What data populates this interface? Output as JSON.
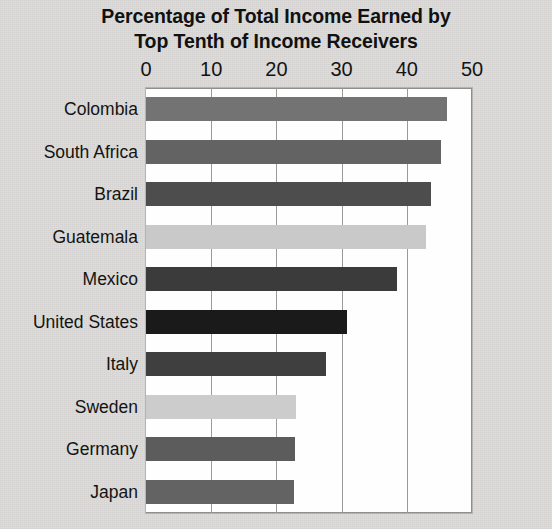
{
  "chart_data": {
    "type": "bar",
    "orientation": "horizontal",
    "title": "Percentage of Total Income Earned by Top Tenth of Income Receivers",
    "title_line1": "Percentage of Total Income Earned by",
    "title_line2": "Top Tenth of Income Receivers",
    "xlabel": "",
    "ylabel": "",
    "xlim": [
      0,
      50
    ],
    "xticks": [
      0,
      10,
      20,
      30,
      40,
      50
    ],
    "xtick_labels": [
      "0",
      "10",
      "20",
      "30",
      "40",
      "50"
    ],
    "grid": "vertical",
    "legend": "none",
    "categories": [
      "Colombia",
      "South Africa",
      "Brazil",
      "Guatemala",
      "Mexico",
      "United States",
      "Italy",
      "Sweden",
      "Germany",
      "Japan"
    ],
    "values": [
      46.1,
      45.3,
      43.7,
      43.0,
      38.5,
      30.8,
      27.6,
      23.0,
      22.9,
      22.7
    ],
    "bar_colors": [
      "#737373",
      "#636363",
      "#4d4d4d",
      "#c9c9c9",
      "#3b3b3b",
      "#1a1a1a",
      "#3f3f3f",
      "#cccccc",
      "#5c5c5c",
      "#636363"
    ],
    "bars": [
      {
        "label": "Colombia",
        "value": 46.1,
        "color": "#737373"
      },
      {
        "label": "South Africa",
        "value": 45.3,
        "color": "#636363"
      },
      {
        "label": "Brazil",
        "value": 43.7,
        "color": "#4d4d4d"
      },
      {
        "label": "Guatemala",
        "value": 43.0,
        "color": "#c9c9c9"
      },
      {
        "label": "Mexico",
        "value": 38.5,
        "color": "#3b3b3b"
      },
      {
        "label": "United States",
        "value": 30.8,
        "color": "#1a1a1a"
      },
      {
        "label": "Italy",
        "value": 27.6,
        "color": "#3f3f3f"
      },
      {
        "label": "Sweden",
        "value": 23.0,
        "color": "#cccccc"
      },
      {
        "label": "Germany",
        "value": 22.9,
        "color": "#5c5c5c"
      },
      {
        "label": "Japan",
        "value": 22.7,
        "color": "#636363"
      }
    ]
  },
  "style": {
    "page_background": "#dddcda",
    "plot_background": "#fefefe",
    "gridline_color": "#9a9a98",
    "text_color": "#131313"
  }
}
